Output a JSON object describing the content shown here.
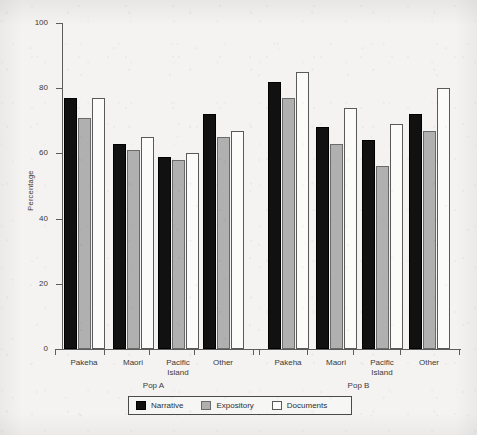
{
  "chart_data": {
    "type": "bar",
    "title": "",
    "xlabel": "",
    "ylabel": "Percentage",
    "ylim": [
      0,
      100
    ],
    "yticks": [
      0,
      20,
      40,
      60,
      80,
      100
    ],
    "grid": false,
    "legend_position": "bottom",
    "groups": [
      {
        "name": "Pop A",
        "label": "Pop A",
        "categories": [
          "Pakeha",
          "Maori",
          "Pacific\nIsland",
          "Other"
        ]
      },
      {
        "name": "Pop B",
        "label": "Pop B",
        "categories": [
          "Pakeha",
          "Maori",
          "Pacific\nIsland",
          "Other"
        ]
      }
    ],
    "categories": [
      "Pakeha",
      "Maori",
      "Pacific Island",
      "Other",
      "Pakeha",
      "Maori",
      "Pacific Island",
      "Other"
    ],
    "series": [
      {
        "name": "Narrative",
        "color": "#111111",
        "values": [
          77,
          63,
          59,
          72,
          82,
          68,
          64,
          72
        ]
      },
      {
        "name": "Expository",
        "color": "#b0b0b0",
        "values": [
          71,
          61,
          58,
          65,
          77,
          63,
          56,
          67
        ]
      },
      {
        "name": "Documents",
        "color": "#ffffff",
        "values": [
          77,
          65,
          60,
          67,
          85,
          74,
          69,
          80
        ]
      }
    ]
  },
  "axis": {
    "y_title": "Percentage",
    "y_tick_labels": [
      "0",
      "20",
      "40",
      "60",
      "80",
      "100"
    ]
  },
  "legend": {
    "items": [
      {
        "label": "Narrative"
      },
      {
        "label": "Expository"
      },
      {
        "label": "Documents"
      }
    ]
  }
}
